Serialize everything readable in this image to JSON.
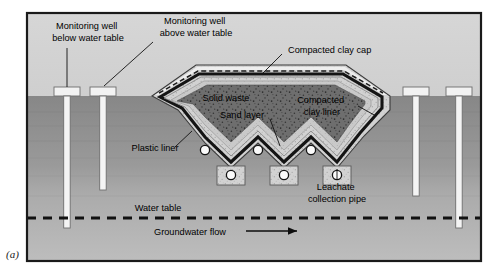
{
  "figure": {
    "panel_letter": "(a)",
    "frame": {
      "x": 26,
      "y": 12,
      "width": 456,
      "height": 250,
      "border_color": "#1a1a1a",
      "border_width": 2
    }
  },
  "palette": {
    "sky": "#d2d2d2",
    "ground_upper": "#8c8c8c",
    "ground_lower": "#b4b4b4",
    "ground_mid": "#a0a0a0",
    "solid_waste": "#6e6e6e",
    "clay_liner": "#cfcfcf",
    "sand": "#c8c8c8",
    "plastic_liner": "#1c1c1c",
    "well_fill": "#f2f2f2",
    "well_stroke": "#6a6a6a",
    "pipe_fill": "#ffffff",
    "pipe_stroke": "#1c1c1c",
    "text": "#000000",
    "water_table_line": "#111111"
  },
  "labels": {
    "monitoring_well_below": {
      "lines": [
        "Monitoring well",
        "below water table"
      ],
      "x": 88,
      "y": 34
    },
    "monitoring_well_above": {
      "lines": [
        "Monitoring well",
        "above water table"
      ],
      "x": 165,
      "y": 20
    },
    "compacted_clay_cap": {
      "lines": [
        "Compacted clay cap"
      ],
      "x": 345,
      "y": 54
    },
    "solid_waste": {
      "lines": [
        "Solid waste"
      ],
      "x": 225,
      "y": 99
    },
    "sand_layer": {
      "lines": [
        "Sand layer"
      ],
      "x": 245,
      "y": 115
    },
    "compacted_clay_liner": {
      "lines": [
        "Compacted",
        "clay liner"
      ],
      "x": 327,
      "y": 101
    },
    "plastic_liner": {
      "lines": [
        "Plastic liner"
      ],
      "x": 160,
      "y": 154
    },
    "leachate_collection": {
      "lines": [
        "Leachate",
        "collection pipe"
      ],
      "x": 334,
      "y": 186
    },
    "water_table": {
      "lines": [
        "Water table"
      ],
      "x": 160,
      "y": 206
    },
    "groundwater_flow": {
      "lines": [
        "Groundwater flow"
      ],
      "x": 190,
      "y": 231
    }
  },
  "ground": {
    "surface_y": 96,
    "water_table_y": 218,
    "water_table_dash": "9 7",
    "water_table_width": 3.2
  },
  "arrow": {
    "name": "groundwater-flow-arrow",
    "x1": 246,
    "x2": 300,
    "y": 231
  },
  "monitoring_wells": [
    {
      "id": "well-1",
      "label": "below water table",
      "cap_cx": 67,
      "cap_w": 26,
      "cap_h": 9,
      "shaft_w": 6.5,
      "bottom_y": 228
    },
    {
      "id": "well-2",
      "label": "above water table",
      "cap_cx": 103,
      "cap_w": 26,
      "cap_h": 9,
      "shaft_w": 6.5,
      "bottom_y": 190
    },
    {
      "id": "well-3",
      "label": "right-inner",
      "cap_cx": 416,
      "cap_w": 26,
      "cap_h": 9,
      "shaft_w": 6.5,
      "bottom_y": 196
    },
    {
      "id": "well-4",
      "label": "right-outer",
      "cap_cx": 459,
      "cap_w": 26,
      "cap_h": 9,
      "shaft_w": 6.5,
      "bottom_y": 228
    }
  ],
  "leachate_pipes_upper": [
    {
      "cx": 205,
      "cy": 152
    },
    {
      "cx": 258,
      "cy": 152
    },
    {
      "cx": 311,
      "cy": 152
    }
  ],
  "leachate_pipes_lower": [
    {
      "cx": 231,
      "cy": 175
    },
    {
      "cx": 284,
      "cy": 175
    },
    {
      "cx": 337,
      "cy": 175
    }
  ],
  "landfill": {
    "cap_dash_pattern": "5 3",
    "left_toe_x": 152,
    "right_toe_x": 390,
    "crest_left_x": 196,
    "crest_right_x": 346,
    "crest_y": 68,
    "base_y": 140
  }
}
